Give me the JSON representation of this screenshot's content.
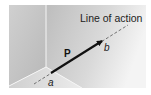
{
  "figure": {
    "caption_label": "Line of action",
    "force_label": "P",
    "point_a_label": "a",
    "point_b_label": "b",
    "colors": {
      "background": "#ffffff",
      "wall_left": "#c4c4c4",
      "wall_right_start": "#bdbdbd",
      "wall_right_end": "#f2f2f2",
      "floor": "#dcdcdc",
      "edge": "#f5f5f5",
      "arrow": "#111111",
      "dash": "#555555",
      "text": "#222222"
    }
  }
}
